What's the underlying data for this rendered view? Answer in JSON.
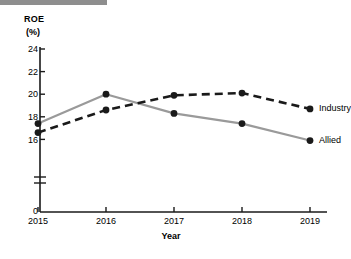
{
  "figure": {
    "accent_bar_color": "#8e8e8e",
    "background_color": "#ffffff"
  },
  "chart_data": {
    "type": "line",
    "title": "",
    "xlabel": "Year",
    "ylabel": "ROE",
    "ylabel_unit": "(%)",
    "categories": [
      "2015",
      "2016",
      "2017",
      "2018",
      "2019"
    ],
    "x": [
      2015,
      2016,
      2017,
      2018,
      2019
    ],
    "ylim": [
      0,
      24
    ],
    "y_axis_break": true,
    "y_break_between": [
      0,
      16
    ],
    "yticks": [
      "0",
      "16",
      "18",
      "20",
      "22",
      "24"
    ],
    "xticks": [
      "2015",
      "2016",
      "2017",
      "2018",
      "2019"
    ],
    "grid": false,
    "legend_position": "right-of-endpoint",
    "series": [
      {
        "name": "Allied",
        "color": "#9a9a9a",
        "style": "solid",
        "marker": "circle",
        "marker_color": "#1a1a1a",
        "values": [
          17.4,
          20.0,
          18.3,
          17.4,
          15.9
        ]
      },
      {
        "name": "Industry",
        "color": "#1a1a1a",
        "style": "dashed",
        "marker": "circle",
        "marker_color": "#1a1a1a",
        "values": [
          16.6,
          18.6,
          19.9,
          20.1,
          18.7
        ]
      }
    ]
  },
  "labels": {
    "y_title": "ROE",
    "y_unit": "(%)",
    "x_title": "Year",
    "tick_0": "0",
    "tick_16": "16",
    "tick_18": "18",
    "tick_20": "20",
    "tick_22": "22",
    "tick_24": "24",
    "year_2015": "2015",
    "year_2016": "2016",
    "year_2017": "2017",
    "year_2018": "2018",
    "year_2019": "2019",
    "series_industry": "Industry",
    "series_allied": "Allied"
  }
}
